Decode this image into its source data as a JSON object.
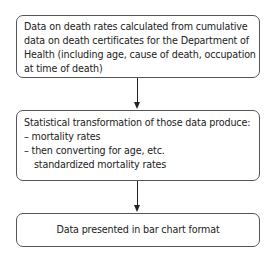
{
  "diagram": {
    "type": "flowchart",
    "direction": "top-to-bottom",
    "nodes": [
      {
        "id": "source",
        "lines": [
          "Data on death rates calculated from cumulative",
          "data on death certificates for the Department of",
          "Health (including age, cause of death, occupation",
          "at time of death)"
        ]
      },
      {
        "id": "transform",
        "lines": [
          "Statistical transformation of those data produce:",
          "– mortality rates",
          "– then converting for age, etc.",
          "standardized mortality rates"
        ]
      },
      {
        "id": "output",
        "lines": [
          "Data presented in bar chart format"
        ]
      }
    ],
    "edges": [
      {
        "from": "source",
        "to": "transform"
      },
      {
        "from": "transform",
        "to": "output"
      }
    ]
  }
}
